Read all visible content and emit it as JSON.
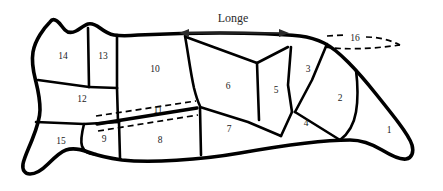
{
  "diagram": {
    "background_color": "#ffffff",
    "line_color": "#000000",
    "label_color": "#1a1a1a",
    "annotation_color": "#2b2b2b",
    "annotations": [
      {
        "id": "longe",
        "text": "Longe",
        "x": 233,
        "y": 19,
        "arrow": {
          "x1": 180,
          "x2": 288,
          "y": 33,
          "double_headed": true
        }
      }
    ],
    "regions": [
      {
        "id": "r1",
        "label": "1",
        "x": 389,
        "y": 131
      },
      {
        "id": "r2",
        "label": "2",
        "x": 340,
        "y": 99
      },
      {
        "id": "r3",
        "label": "3",
        "x": 308,
        "y": 70
      },
      {
        "id": "r4",
        "label": "4",
        "x": 306,
        "y": 124
      },
      {
        "id": "r5",
        "label": "5",
        "x": 276,
        "y": 91
      },
      {
        "id": "r6",
        "label": "6",
        "x": 228,
        "y": 87
      },
      {
        "id": "r7",
        "label": "7",
        "x": 229,
        "y": 130
      },
      {
        "id": "r8",
        "label": "8",
        "x": 160,
        "y": 141
      },
      {
        "id": "r9",
        "label": "9",
        "x": 104,
        "y": 140
      },
      {
        "id": "r10",
        "label": "10",
        "x": 155,
        "y": 70
      },
      {
        "id": "r11",
        "label": "11",
        "x": 158,
        "y": 111
      },
      {
        "id": "r12",
        "label": "12",
        "x": 82,
        "y": 100
      },
      {
        "id": "r13",
        "label": "13",
        "x": 103,
        "y": 57
      },
      {
        "id": "r14",
        "label": "14",
        "x": 63,
        "y": 57
      },
      {
        "id": "r15",
        "label": "15",
        "x": 61,
        "y": 142
      },
      {
        "id": "r16",
        "label": "16",
        "x": 355,
        "y": 39
      }
    ]
  }
}
